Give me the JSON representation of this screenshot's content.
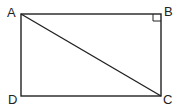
{
  "diagram": {
    "type": "geometry",
    "shape": "rectangle",
    "vertices": [
      {
        "label": "A",
        "x": 21,
        "y": 14
      },
      {
        "label": "B",
        "x": 161,
        "y": 14
      },
      {
        "label": "C",
        "x": 161,
        "y": 96
      },
      {
        "label": "D",
        "x": 21,
        "y": 96
      }
    ],
    "segments": [
      "AB",
      "BC",
      "CD",
      "DA",
      "AC"
    ],
    "right_angle_at": "B",
    "stroke_color": "#222222"
  }
}
